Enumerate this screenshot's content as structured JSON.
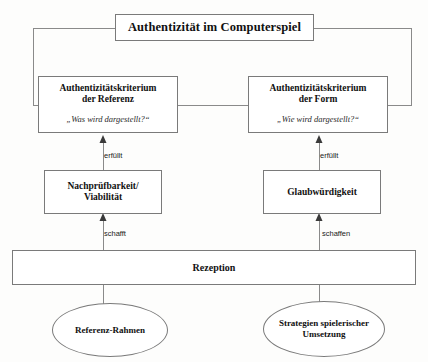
{
  "diagram": {
    "title": "Authentizität im Computerspiel",
    "language": "de",
    "nodes": {
      "root": {
        "label": "Authentizität im Computerspiel",
        "shape": "rectangle"
      },
      "criterion_reference": {
        "label_line1": "Authentizitätskriterium",
        "label_line2": "der Referenz",
        "question": "„Was wird dargestellt?“",
        "shape": "rectangle"
      },
      "criterion_form": {
        "label_line1": "Authentizitätskriterium",
        "label_line2": "der Form",
        "question": "„Wie wird dargestellt?“",
        "shape": "rectangle"
      },
      "viability": {
        "label_line1": "Nachprüfbarkeit/",
        "label_line2": "Viabilität",
        "shape": "rectangle"
      },
      "credibility": {
        "label": "Glaubwürdigkeit",
        "shape": "rectangle"
      },
      "reception": {
        "label": "Rezeption",
        "shape": "rectangle"
      },
      "reference_frame": {
        "label": "Referenz-Rahmen",
        "shape": "ellipse"
      },
      "strategies": {
        "label_line1": "Strategien spielerischer",
        "label_line2": "Umsetzung",
        "shape": "ellipse"
      }
    },
    "edge_labels": {
      "erfuellt_left": "erfüllt",
      "erfuellt_right": "erfüllt",
      "schafft_left": "schafft",
      "schaffen_right": "schaffen"
    },
    "colors": {
      "background": "#fdfdfc",
      "node_fill": "#ffffff",
      "node_stroke": "#7a7a7a",
      "edge_stroke": "#8a8a8a",
      "text": "#111111"
    }
  }
}
